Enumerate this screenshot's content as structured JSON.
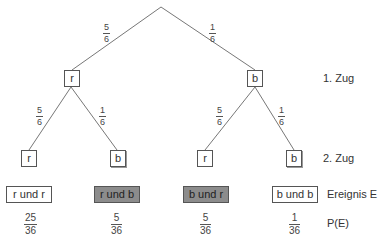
{
  "tree": {
    "root_branches": [
      {
        "num": "5",
        "den": "6"
      },
      {
        "num": "1",
        "den": "6"
      }
    ],
    "level1": [
      {
        "label": "r",
        "branches": [
          {
            "num": "5",
            "den": "6"
          },
          {
            "num": "1",
            "den": "6"
          }
        ]
      },
      {
        "label": "b",
        "branches": [
          {
            "num": "5",
            "den": "6"
          },
          {
            "num": "1",
            "den": "6"
          }
        ]
      }
    ],
    "level2": [
      "r",
      "b",
      "r",
      "b"
    ]
  },
  "row_labels": {
    "first_draw": "1. Zug",
    "second_draw": "2. Zug",
    "event": "Ereignis E",
    "probability": "P(E)"
  },
  "events": [
    {
      "label": "r und r",
      "highlighted": false,
      "num": "25",
      "den": "36"
    },
    {
      "label": "r und b",
      "highlighted": true,
      "num": "5",
      "den": "36"
    },
    {
      "label": "b und r",
      "highlighted": true,
      "num": "5",
      "den": "36"
    },
    {
      "label": "b und b",
      "highlighted": false,
      "num": "1",
      "den": "36"
    }
  ],
  "colors": {
    "line": "#777777",
    "highlight_fill": "#8c8c8c"
  }
}
